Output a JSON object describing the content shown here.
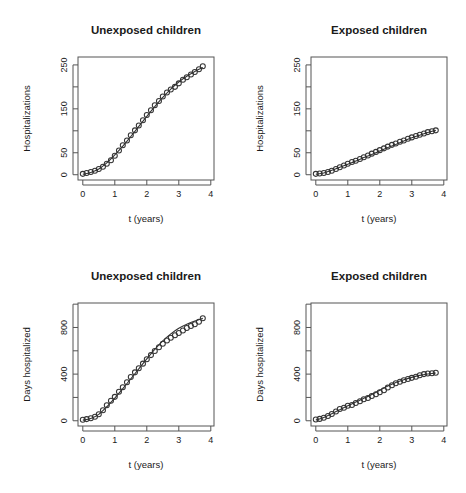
{
  "figure": {
    "layout": "2x2 panel grid",
    "panels": [
      "hosp_unexposed",
      "hosp_exposed",
      "days_unexposed",
      "days_exposed"
    ]
  },
  "chart_data": [
    {
      "id": "hosp_unexposed",
      "type": "scatter",
      "title": "Unexposed children",
      "xlabel": "t (years)",
      "ylabel": "Hospitalizations",
      "xlim": [
        -0.15,
        4.1
      ],
      "ylim": [
        -12,
        268
      ],
      "xticks": [
        0,
        1,
        2,
        3,
        4
      ],
      "xticklabels": [
        "0",
        "1",
        "2",
        "3",
        "4"
      ],
      "yticks": [
        0,
        50,
        100,
        150,
        200,
        250
      ],
      "yticklabels": [
        "0",
        "50",
        "",
        "150",
        "",
        "250"
      ],
      "grid": false,
      "legend": "none",
      "marker": "open-circle",
      "x": [
        0.0,
        0.12,
        0.25,
        0.38,
        0.5,
        0.63,
        0.75,
        0.88,
        1.0,
        1.13,
        1.25,
        1.38,
        1.5,
        1.63,
        1.75,
        1.88,
        2.0,
        2.13,
        2.25,
        2.38,
        2.5,
        2.63,
        2.75,
        2.88,
        3.0,
        3.13,
        3.25,
        3.38,
        3.5,
        3.63,
        3.75
      ],
      "y": [
        2,
        4,
        6,
        9,
        13,
        18,
        25,
        33,
        43,
        55,
        67,
        78,
        90,
        101,
        112,
        124,
        136,
        147,
        158,
        168,
        178,
        187,
        194,
        200,
        208,
        216,
        222,
        228,
        234,
        240,
        247
      ],
      "fit_x": [
        0.0,
        0.25,
        0.5,
        0.75,
        1.0,
        1.25,
        1.5,
        1.75,
        2.0,
        2.25,
        2.5,
        2.75,
        3.0,
        3.25,
        3.5,
        3.75
      ],
      "fit_y": [
        1,
        5,
        13,
        27,
        45,
        65,
        87,
        110,
        133,
        155,
        176,
        195,
        211,
        224,
        235,
        244
      ]
    },
    {
      "id": "hosp_exposed",
      "type": "scatter",
      "title": "Exposed children",
      "xlabel": "t (years)",
      "ylabel": "Hospitalizations",
      "xlim": [
        -0.15,
        4.1
      ],
      "ylim": [
        -12,
        268
      ],
      "xticks": [
        0,
        1,
        2,
        3,
        4
      ],
      "xticklabels": [
        "0",
        "1",
        "2",
        "3",
        "4"
      ],
      "yticks": [
        0,
        50,
        100,
        150,
        200,
        250
      ],
      "yticklabels": [
        "0",
        "50",
        "",
        "150",
        "",
        "250"
      ],
      "grid": false,
      "legend": "none",
      "marker": "open-circle",
      "x": [
        0.0,
        0.12,
        0.25,
        0.38,
        0.5,
        0.63,
        0.75,
        0.88,
        1.0,
        1.13,
        1.25,
        1.38,
        1.5,
        1.63,
        1.75,
        1.88,
        2.0,
        2.13,
        2.25,
        2.38,
        2.5,
        2.63,
        2.75,
        2.88,
        3.0,
        3.13,
        3.25,
        3.38,
        3.5,
        3.63,
        3.75
      ],
      "y": [
        2,
        3,
        4,
        6,
        9,
        13,
        17,
        21,
        25,
        29,
        32,
        36,
        40,
        44,
        48,
        52,
        56,
        60,
        64,
        68,
        71,
        75,
        78,
        82,
        85,
        88,
        91,
        94,
        97,
        99,
        101
      ],
      "fit_x": [
        0.0,
        0.25,
        0.5,
        0.75,
        1.0,
        1.25,
        1.5,
        1.75,
        2.0,
        2.25,
        2.5,
        2.75,
        3.0,
        3.25,
        3.5,
        3.75
      ],
      "fit_y": [
        1,
        4,
        10,
        17,
        24,
        31,
        39,
        46,
        54,
        62,
        69,
        77,
        84,
        90,
        96,
        101
      ]
    },
    {
      "id": "days_unexposed",
      "type": "scatter",
      "title": "Unexposed children",
      "xlabel": "t (years)",
      "ylabel": "Days hospitalized",
      "xlim": [
        -0.15,
        4.1
      ],
      "ylim": [
        -45,
        1010
      ],
      "xticks": [
        0,
        1,
        2,
        3,
        4
      ],
      "xticklabels": [
        "0",
        "1",
        "2",
        "3",
        "4"
      ],
      "yticks": [
        0,
        200,
        400,
        600,
        800,
        1000
      ],
      "yticklabels": [
        "0",
        "",
        "400",
        "",
        "800",
        ""
      ],
      "grid": false,
      "legend": "none",
      "marker": "open-circle",
      "x": [
        0.0,
        0.12,
        0.25,
        0.38,
        0.5,
        0.63,
        0.75,
        0.88,
        1.0,
        1.13,
        1.25,
        1.38,
        1.5,
        1.63,
        1.75,
        1.88,
        2.0,
        2.13,
        2.25,
        2.38,
        2.5,
        2.63,
        2.75,
        2.88,
        3.0,
        3.13,
        3.25,
        3.38,
        3.5,
        3.63,
        3.75
      ],
      "y": [
        8,
        14,
        22,
        34,
        55,
        90,
        133,
        172,
        205,
        248,
        287,
        330,
        375,
        415,
        450,
        490,
        528,
        563,
        598,
        630,
        660,
        688,
        712,
        733,
        752,
        775,
        795,
        812,
        828,
        850,
        880
      ],
      "fit_x": [
        0.0,
        0.25,
        0.5,
        0.75,
        1.0,
        1.25,
        1.5,
        1.75,
        2.0,
        2.25,
        2.5,
        2.75,
        3.0,
        3.25,
        3.5,
        3.75
      ],
      "fit_y": [
        5,
        20,
        55,
        120,
        195,
        275,
        360,
        445,
        530,
        612,
        685,
        745,
        793,
        828,
        855,
        878
      ]
    },
    {
      "id": "days_exposed",
      "type": "scatter",
      "title": "Exposed children",
      "xlabel": "t (years)",
      "ylabel": "Days hospitalized",
      "xlim": [
        -0.15,
        4.1
      ],
      "ylim": [
        -45,
        1010
      ],
      "xticks": [
        0,
        1,
        2,
        3,
        4
      ],
      "xticklabels": [
        "0",
        "1",
        "2",
        "3",
        "4"
      ],
      "yticks": [
        0,
        200,
        400,
        600,
        800,
        1000
      ],
      "yticklabels": [
        "0",
        "",
        "400",
        "",
        "800",
        ""
      ],
      "grid": false,
      "legend": "none",
      "marker": "open-circle",
      "x": [
        0.0,
        0.12,
        0.25,
        0.38,
        0.5,
        0.63,
        0.75,
        0.88,
        1.0,
        1.13,
        1.25,
        1.38,
        1.5,
        1.63,
        1.75,
        1.88,
        2.0,
        2.13,
        2.25,
        2.38,
        2.5,
        2.63,
        2.75,
        2.88,
        3.0,
        3.13,
        3.25,
        3.38,
        3.5,
        3.63,
        3.75
      ],
      "y": [
        10,
        16,
        26,
        40,
        58,
        80,
        100,
        112,
        128,
        135,
        152,
        168,
        185,
        196,
        212,
        228,
        245,
        262,
        285,
        305,
        322,
        335,
        348,
        358,
        368,
        378,
        390,
        400,
        405,
        408,
        412
      ],
      "fit_x": [
        0.0,
        0.25,
        0.5,
        0.75,
        1.0,
        1.25,
        1.5,
        1.75,
        2.0,
        2.25,
        2.5,
        2.75,
        3.0,
        3.25,
        3.5,
        3.75
      ],
      "fit_y": [
        6,
        28,
        60,
        95,
        128,
        160,
        192,
        225,
        262,
        298,
        328,
        352,
        372,
        389,
        401,
        410
      ]
    }
  ]
}
